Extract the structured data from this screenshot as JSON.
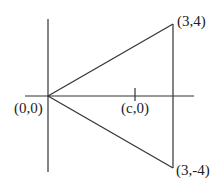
{
  "diagram": {
    "labels": {
      "origin": "(0,0)",
      "top_vertex": "(3,4)",
      "bottom_vertex": "(3,-4)",
      "tick": "(c,0)"
    },
    "colors": {
      "line": "#333333",
      "text": "#222222",
      "background": "#ffffff"
    }
  }
}
